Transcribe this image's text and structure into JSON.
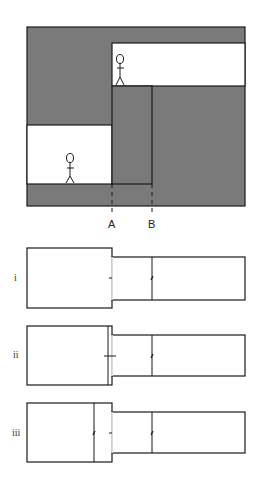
{
  "colors": {
    "fill": "#7a7a7a",
    "line": "#1a1a1a",
    "background": "#ffffff"
  },
  "top_diagram": {
    "markers": [
      {
        "label": "A"
      },
      {
        "label": "B"
      }
    ],
    "figures": [
      {
        "name": "upper-person"
      },
      {
        "name": "lower-person"
      }
    ]
  },
  "options": [
    {
      "label": "i"
    },
    {
      "label": "ii"
    },
    {
      "label": "iii"
    }
  ]
}
